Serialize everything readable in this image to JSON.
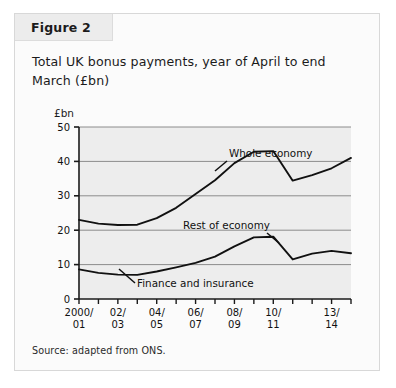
{
  "figure": {
    "tab_label": "Figure 2",
    "title": "Total UK bonus payments, year of April to end March (£bn)",
    "source": "Source: adapted from ONS.",
    "unit_label": "£bn"
  },
  "colors": {
    "card_background": "#fbfbfb",
    "card_border": "#d8d8d8",
    "tab_background": "#ececec",
    "plot_background": "#ededed",
    "gridline": "#8c8c8c",
    "axis": "#1b1b1b",
    "series_line": "#111111",
    "text": "#1b1b1b"
  },
  "chart_data": {
    "type": "line",
    "title": "Total UK bonus payments, year of April to end March (£bn)",
    "xlabel": "",
    "ylabel": "£bn",
    "ylim": [
      0,
      50
    ],
    "yticks": [
      0,
      10,
      20,
      30,
      40,
      50
    ],
    "ytick_labels": [
      "0",
      "10",
      "20",
      "30",
      "40",
      "50"
    ],
    "grid": true,
    "grid_axis": "y",
    "legend": "annotations",
    "x": [
      "2000/01",
      "01/02",
      "02/03",
      "03/04",
      "04/05",
      "05/06",
      "06/07",
      "07/08",
      "08/09",
      "09/10",
      "10/11",
      "11/12",
      "12/13",
      "13/14",
      "14/15"
    ],
    "xtick_labels": [
      "2000/\n01",
      "",
      "02/\n03",
      "",
      "04/\n05",
      "",
      "06/\n07",
      "",
      "08/\n09",
      "",
      "10/\n11",
      "",
      "",
      "13/\n14",
      ""
    ],
    "xtick_labels_shown": [
      {
        "index": 0,
        "line1": "2000/",
        "line2": "01"
      },
      {
        "index": 2,
        "line1": "02/",
        "line2": "03"
      },
      {
        "index": 4,
        "line1": "04/",
        "line2": "05"
      },
      {
        "index": 6,
        "line1": "06/",
        "line2": "07"
      },
      {
        "index": 8,
        "line1": "08/",
        "line2": "09"
      },
      {
        "index": 10,
        "line1": "10/",
        "line2": "11"
      },
      {
        "index": 13,
        "line1": "13/",
        "line2": "14"
      }
    ],
    "series": [
      {
        "name": "Whole economy",
        "values": [
          23.0,
          21.9,
          21.5,
          21.6,
          23.5,
          26.5,
          30.5,
          34.5,
          39.5,
          42.8,
          43.0,
          34.4,
          36.0,
          38.0,
          41.0
        ]
      },
      {
        "name": "Finance and insurance",
        "values": [
          8.6,
          7.6,
          7.1,
          7.0,
          8.0,
          9.2,
          10.5,
          12.3,
          15.3,
          17.9,
          18.1,
          11.5,
          13.2,
          14.0,
          13.3
        ]
      }
    ],
    "annotations": [
      {
        "text": "Whole economy",
        "target_series": "Whole economy",
        "target_x": "09/10"
      },
      {
        "text": "Rest of economy",
        "target_series": "Whole economy",
        "target_x": "12/13"
      },
      {
        "text": "Finance and insurance",
        "target_series": "Finance and insurance",
        "target_x": "04/05"
      }
    ]
  }
}
